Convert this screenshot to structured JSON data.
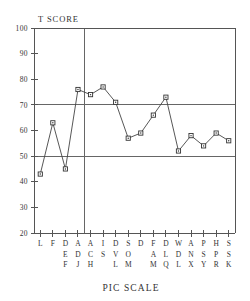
{
  "chart_data": {
    "type": "line",
    "title": "",
    "xlabel": "PIC SCALE",
    "ylabel": "T SCORE",
    "ylim": [
      20,
      100
    ],
    "yticks": [
      20,
      30,
      40,
      50,
      60,
      70,
      80,
      90,
      100
    ],
    "grid": true,
    "gridlines_y": [
      50,
      70
    ],
    "vertical_separator_after_category": "ADJ",
    "legend": null,
    "categories": [
      "L",
      "F",
      "DEF",
      "ADJ",
      "ACH",
      "IS",
      "DVL",
      "SOM",
      "D",
      "FAM",
      "DLQ",
      "WDL",
      "ANX",
      "PSY",
      "HPR",
      "SSK"
    ],
    "values": [
      43,
      63,
      45,
      76,
      74,
      77,
      71,
      57,
      59,
      66,
      73,
      52,
      58,
      54,
      59,
      56
    ],
    "series": [
      {
        "name": "T score profile",
        "values": [
          43,
          63,
          45,
          76,
          74,
          77,
          71,
          57,
          59,
          66,
          73,
          52,
          58,
          54,
          59,
          56
        ]
      }
    ]
  },
  "axes": {
    "y_title": "T SCORE",
    "x_title": "PIC SCALE",
    "y_tick_labels": [
      "100",
      "90",
      "80",
      "70",
      "60",
      "50",
      "40",
      "30",
      "20"
    ]
  },
  "x_categories": [
    {
      "code": "L",
      "chars": [
        "L"
      ]
    },
    {
      "code": "F",
      "chars": [
        "F"
      ]
    },
    {
      "code": "DEF",
      "chars": [
        "D",
        "E",
        "F"
      ]
    },
    {
      "code": "ADJ",
      "chars": [
        "A",
        "D",
        "J"
      ]
    },
    {
      "code": "ACH",
      "chars": [
        "A",
        "C",
        "H"
      ]
    },
    {
      "code": "IS",
      "chars": [
        "I",
        "S"
      ]
    },
    {
      "code": "DVL",
      "chars": [
        "D",
        "V",
        "L"
      ]
    },
    {
      "code": "SOM",
      "chars": [
        "S",
        "O",
        "M"
      ]
    },
    {
      "code": "D",
      "chars": [
        "D"
      ]
    },
    {
      "code": "FAM",
      "chars": [
        "F",
        "A",
        "M"
      ]
    },
    {
      "code": "DLQ",
      "chars": [
        "D",
        "L",
        "Q"
      ]
    },
    {
      "code": "WDL",
      "chars": [
        "W",
        "D",
        "L"
      ]
    },
    {
      "code": "ANX",
      "chars": [
        "A",
        "N",
        "X"
      ]
    },
    {
      "code": "PSY",
      "chars": [
        "P",
        "S",
        "Y"
      ]
    },
    {
      "code": "HPR",
      "chars": [
        "H",
        "P",
        "R"
      ]
    },
    {
      "code": "SSK",
      "chars": [
        "S",
        "S",
        "K"
      ]
    }
  ],
  "colors": {
    "background": "#ffffff",
    "line": "#444444",
    "marker_stroke": "#333333",
    "marker_fill": "#ffffff",
    "axis": "#555555",
    "grid": "#666666",
    "text": "#333333"
  }
}
